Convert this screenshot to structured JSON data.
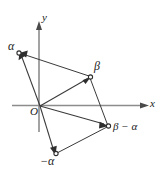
{
  "figure": {
    "type": "vector-diagram",
    "axes": {
      "x_label": "x",
      "y_label": "y",
      "origin_label": "O"
    },
    "points": [
      {
        "id": "alpha",
        "label": "α",
        "x": 19,
        "y": 53
      },
      {
        "id": "beta",
        "label": "β",
        "x": 90,
        "y": 77
      },
      {
        "id": "beta_minus_alpha",
        "label": "β − α",
        "x": 108,
        "y": 126
      },
      {
        "id": "neg_alpha",
        "label": "−α",
        "x": 56,
        "y": 154
      }
    ],
    "colors": {
      "axis": "#8c8c8c",
      "vector": "#3a3a3a",
      "label": "#1a1a1a",
      "background": "#ffffff"
    }
  }
}
